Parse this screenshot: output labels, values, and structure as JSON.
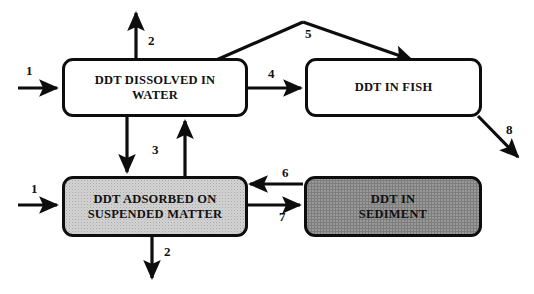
{
  "diagram": {
    "colors": {
      "stroke": "#0d0d0d",
      "white_fill": "#ffffff",
      "light_gray_fill": "#d2d2d2",
      "dark_gray_fill": "#9d9d9d",
      "text": "#111111"
    },
    "nodes": [
      {
        "id": "ddt-dissolved-in-water",
        "label": "DDT DISSOLVED IN\nWATER",
        "fill": "white"
      },
      {
        "id": "ddt-in-fish",
        "label": "DDT IN FISH",
        "fill": "white"
      },
      {
        "id": "ddt-adsorbed-on-suspended-matter",
        "label": "DDT ADSORBED ON\nSUSPENDED MATTER",
        "fill": "light_gray"
      },
      {
        "id": "ddt-in-sediment",
        "label": "DDT IN\nSEDIMENT",
        "fill": "dark_gray"
      }
    ],
    "flows": [
      {
        "id": "flow-1-water-input",
        "number": "1",
        "from": "external",
        "to": "ddt-dissolved-in-water",
        "direction": "right"
      },
      {
        "id": "flow-2-water-output",
        "number": "2",
        "from": "ddt-dissolved-in-water",
        "to": "external",
        "direction": "up"
      },
      {
        "id": "flow-3-water-to-suspended",
        "number": "3",
        "from": "ddt-dissolved-in-water",
        "to": "ddt-adsorbed-on-suspended-matter",
        "direction": "down"
      },
      {
        "id": "flow-3-suspended-to-water",
        "number": "3",
        "from": "ddt-adsorbed-on-suspended-matter",
        "to": "ddt-dissolved-in-water",
        "direction": "up"
      },
      {
        "id": "flow-4-water-to-fish",
        "number": "4",
        "from": "ddt-dissolved-in-water",
        "to": "ddt-in-fish",
        "direction": "right"
      },
      {
        "id": "flow-5-water-to-fish-overhead",
        "number": "5",
        "from": "ddt-dissolved-in-water",
        "to": "ddt-in-fish",
        "direction": "arc-over"
      },
      {
        "id": "flow-6-sediment-to-suspended",
        "number": "6",
        "from": "ddt-in-sediment",
        "to": "ddt-adsorbed-on-suspended-matter",
        "direction": "left"
      },
      {
        "id": "flow-7-suspended-to-sediment",
        "number": "7",
        "from": "ddt-adsorbed-on-suspended-matter",
        "to": "ddt-in-sediment",
        "direction": "right"
      },
      {
        "id": "flow-8-fish-output",
        "number": "8",
        "from": "ddt-in-fish",
        "to": "external",
        "direction": "down-right"
      },
      {
        "id": "flow-1-suspended-input",
        "number": "1",
        "from": "external",
        "to": "ddt-adsorbed-on-suspended-matter",
        "direction": "right"
      },
      {
        "id": "flow-2-suspended-output",
        "number": "2",
        "from": "ddt-adsorbed-on-suspended-matter",
        "to": "external",
        "direction": "down"
      }
    ],
    "flow_labels": {
      "n1_top": "1",
      "n2_top": "2",
      "n3_mid": "3",
      "n4": "4",
      "n5": "5",
      "n6": "6",
      "n7": "7",
      "n8": "8",
      "n1_bottom": "1",
      "n2_bottom": "2"
    }
  }
}
